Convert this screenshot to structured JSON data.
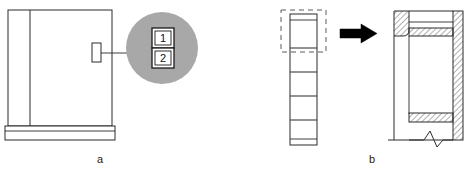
{
  "figure": {
    "background_color": "#ffffff",
    "line_color": "#2b2b2b",
    "detail_circle_fill": "#a8a8a8",
    "arrow_color": "#000000",
    "hatch_color": "#3a3a3a"
  },
  "panel_a": {
    "caption": "a",
    "cabinet": {
      "label": "cabinet-front-elevation",
      "left_panel_label": "left-side-panel",
      "base_label": "base-plinth",
      "body_fill": "#ffffff"
    },
    "marker": {
      "label": "component-location-marker"
    },
    "leader": {
      "label": "leader-line"
    },
    "detail_circle": {
      "label": "detail-view-circle",
      "fill": "#a8a8a8",
      "items": [
        {
          "id": "1",
          "label": "1",
          "name": "callout-item-1"
        },
        {
          "id": "2",
          "label": "2",
          "name": "callout-item-2"
        }
      ]
    }
  },
  "panel_b": {
    "caption": "b",
    "strip": {
      "label": "segmented-profile-strip",
      "segments": 6
    },
    "selection": {
      "label": "dashed-selection-region"
    },
    "arrow": {
      "label": "transformation-arrow",
      "direction": "right"
    },
    "section": {
      "label": "cross-section-detail-view",
      "break_symbol": "zigzag-break-line",
      "hatch_pattern": "diagonal-section-hatch"
    }
  }
}
